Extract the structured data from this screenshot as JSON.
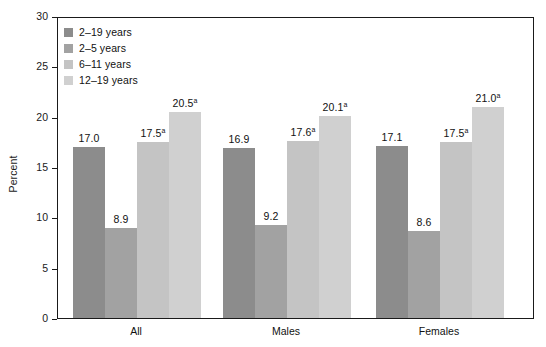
{
  "chart_data": {
    "type": "bar",
    "title": "",
    "xlabel": "",
    "ylabel": "Percent",
    "ylim": [
      0,
      30
    ],
    "yticks": [
      0,
      5,
      10,
      15,
      20,
      25,
      30
    ],
    "ytick_labels": [
      "0",
      "5",
      "10",
      "15",
      "20",
      "25",
      "30"
    ],
    "grid": false,
    "legend_position": "top-left-inside",
    "categories": [
      "All",
      "Males",
      "Females"
    ],
    "series": [
      {
        "name": "2–19 years",
        "color": "#8c8c8c",
        "values": [
          17.0,
          16.9,
          17.1
        ],
        "labels": [
          "17.0",
          "16.9",
          "17.1"
        ],
        "footnotes": [
          "",
          "",
          ""
        ]
      },
      {
        "name": "2–5 years",
        "color": "#a2a2a2",
        "values": [
          8.9,
          9.2,
          8.6
        ],
        "labels": [
          "8.9",
          "9.2",
          "8.6"
        ],
        "footnotes": [
          "",
          "",
          ""
        ]
      },
      {
        "name": "6–11 years",
        "color": "#c4c4c4",
        "values": [
          17.5,
          17.6,
          17.5
        ],
        "labels": [
          "17.5",
          "17.6",
          "17.5"
        ],
        "footnotes": [
          "a",
          "a",
          "a"
        ]
      },
      {
        "name": "12–19 years",
        "color": "#d0d0d0",
        "values": [
          20.5,
          20.1,
          21.0
        ],
        "labels": [
          "20.5",
          "20.1",
          "21.0"
        ],
        "footnotes": [
          "a",
          "a",
          "a"
        ]
      }
    ],
    "annotations": []
  },
  "axis": {
    "frame_color": "#1a1a1a",
    "text_color": "#111111"
  }
}
